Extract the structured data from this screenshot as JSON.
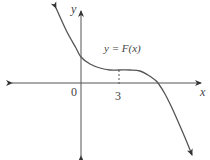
{
  "chart_data": {
    "type": "line",
    "title": "",
    "function_label": "y = F(x)",
    "xlabel": "x",
    "ylabel": "y",
    "x_ticks": [
      {
        "value": 0,
        "label": "0"
      },
      {
        "value": 3,
        "label": "3"
      }
    ],
    "y_ticks": [],
    "grid": false,
    "legend": "none",
    "annotations": [
      {
        "type": "dashed-vertical",
        "x": 3,
        "from": "x-axis",
        "to": "curve"
      }
    ],
    "series": [
      {
        "name": "F(x)",
        "points_px": [
          [
            56,
            8
          ],
          [
            66,
            30
          ],
          [
            76,
            48
          ],
          [
            81,
            57
          ],
          [
            90,
            64
          ],
          [
            100,
            68
          ],
          [
            110,
            70
          ],
          [
            119,
            70
          ],
          [
            130,
            70
          ],
          [
            140,
            71
          ],
          [
            148,
            75
          ],
          [
            155,
            80
          ],
          [
            158,
            83
          ],
          [
            165,
            94
          ],
          [
            172,
            108
          ],
          [
            180,
            126
          ],
          [
            186,
            140
          ],
          [
            192,
            155
          ]
        ]
      }
    ],
    "colors": {
      "curve": "#555555",
      "axes": "#444444",
      "text": "#444444"
    }
  },
  "labels": {
    "y_axis": "y",
    "x_axis": "x",
    "origin": "0",
    "tick_3": "3",
    "curve": "y = F(x)"
  }
}
